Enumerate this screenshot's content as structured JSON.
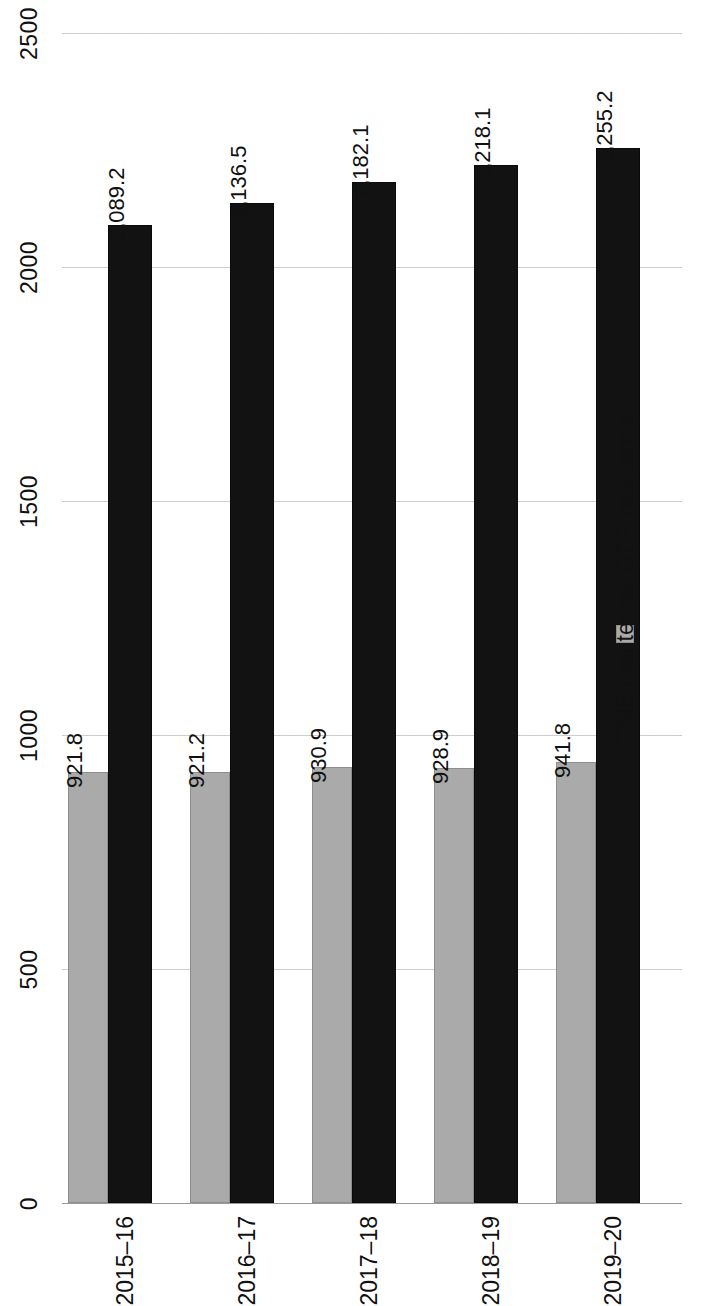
{
  "chart_data": {
    "type": "bar",
    "title": "",
    "xlabel": "",
    "ylabel": "",
    "orientation": "vertical-bars-rotated-90",
    "categories": [
      "2015–16",
      "2016–17",
      "2017–18",
      "2018–19",
      "2019–20"
    ],
    "series": [
      {
        "name": "TME real terms",
        "color": "#aaaaaa",
        "values": [
          921.8,
          921.2,
          930.9,
          928.9,
          941.8
        ],
        "labels": [
          "921.8",
          "921.2",
          "930.9",
          "928.9",
          "941.8"
        ]
      },
      {
        "name": "GDP real terms",
        "color": "#121212",
        "values": [
          2089.2,
          2136.5,
          2182.1,
          2218.1,
          2255.2
        ],
        "labels": [
          "2,089.2",
          "2,136.5",
          "2,182.1",
          "2,218.1",
          "2,255.2"
        ]
      }
    ],
    "ylim": [
      0,
      2500
    ],
    "yticks": [
      0,
      500,
      1000,
      1500,
      2000,
      2500
    ],
    "ytick_labels": [
      "0",
      "500",
      "1000",
      "1500",
      "2000",
      "2500"
    ],
    "grid": true,
    "legend_position": "right",
    "legend": [
      {
        "label": "TME real terms",
        "color": "#aaaaaa"
      },
      {
        "label": "GDP real terms",
        "color": "#121212"
      }
    ]
  }
}
